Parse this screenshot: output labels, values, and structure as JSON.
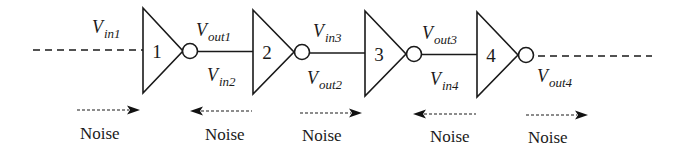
{
  "diagram": {
    "type": "inverter-chain",
    "colors": {
      "stroke": "#1a1a1a",
      "background": "#ffffff"
    },
    "gates": [
      {
        "number": "1",
        "left_x": 143,
        "top_y": 8,
        "bottom_y": 93,
        "tip_x": 183,
        "mid_y": 51,
        "bubble_cx": 190
      },
      {
        "number": "2",
        "left_x": 253,
        "top_y": 10,
        "bottom_y": 94,
        "tip_x": 294,
        "mid_y": 52,
        "bubble_cx": 302
      },
      {
        "number": "3",
        "left_x": 365,
        "top_y": 11,
        "bottom_y": 96,
        "tip_x": 406,
        "mid_y": 54,
        "bubble_cx": 414
      },
      {
        "number": "4",
        "left_x": 477,
        "top_y": 12,
        "bottom_y": 97,
        "tip_x": 518,
        "mid_y": 55,
        "bubble_cx": 526
      }
    ],
    "labels": [
      {
        "id": "vin1",
        "main": "V",
        "sub": "in1",
        "x": 92,
        "y": 33
      },
      {
        "id": "vout1",
        "main": "V",
        "sub": "out1",
        "x": 196,
        "y": 36
      },
      {
        "id": "vin2",
        "main": "V",
        "sub": "in2",
        "x": 207,
        "y": 81
      },
      {
        "id": "vin3",
        "main": "V",
        "sub": "in3",
        "x": 313,
        "y": 37
      },
      {
        "id": "vout2",
        "main": "V",
        "sub": "out2",
        "x": 307,
        "y": 84
      },
      {
        "id": "vout3",
        "main": "V",
        "sub": "out3",
        "x": 422,
        "y": 39
      },
      {
        "id": "vin4",
        "main": "V",
        "sub": "in4",
        "x": 430,
        "y": 85
      },
      {
        "id": "vout4",
        "main": "V",
        "sub": "out4",
        "x": 537,
        "y": 82
      }
    ],
    "noise": [
      {
        "label": "Noise",
        "direction": "right",
        "x1": 77,
        "x2": 140,
        "y": 110,
        "label_x": 80,
        "label_y": 139
      },
      {
        "label": "Noise",
        "direction": "left",
        "x1": 190,
        "x2": 252,
        "y": 111,
        "label_x": 205,
        "label_y": 140
      },
      {
        "label": "Noise",
        "direction": "right",
        "x1": 300,
        "x2": 362,
        "y": 113,
        "label_x": 302,
        "label_y": 141
      },
      {
        "label": "Noise",
        "direction": "left",
        "x1": 413,
        "x2": 476,
        "y": 114,
        "label_x": 430,
        "label_y": 142
      },
      {
        "label": "Noise",
        "direction": "right",
        "x1": 526,
        "x2": 588,
        "y": 115,
        "label_x": 528,
        "label_y": 143
      }
    ],
    "input_line": {
      "x1": 33,
      "x2": 143,
      "y": 50
    },
    "output_line": {
      "x1": 534,
      "x2": 652,
      "y": 56
    }
  }
}
